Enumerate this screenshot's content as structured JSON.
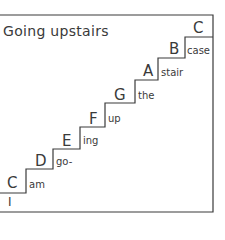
{
  "caption": "Music of the Stairs",
  "title": "Going upstairs",
  "steps": [
    {
      "note": "C",
      "word": "am"
    },
    {
      "note": "D",
      "word": "go-"
    },
    {
      "note": "E",
      "word": "ing"
    },
    {
      "note": "F",
      "word": "up"
    },
    {
      "note": "G",
      "word": "the"
    },
    {
      "note": "A",
      "word": "stair"
    },
    {
      "note": "B",
      "word": "case"
    },
    {
      "note": "C",
      "word": ""
    }
  ],
  "start_word": "I",
  "colors": {
    "line": "#3a3a3a",
    "background": "#ffffff"
  }
}
